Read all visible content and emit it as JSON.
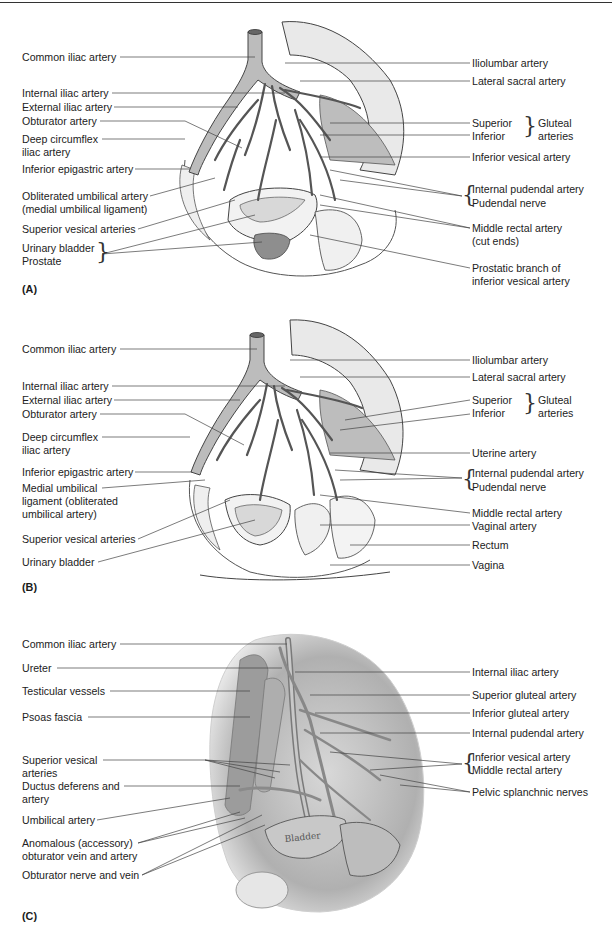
{
  "figure": {
    "panels": [
      {
        "id": "A",
        "panel_label": "(A)",
        "left_labels": [
          "Common iliac artery",
          "Internal iliac artery",
          "External iliac artery",
          "Obturator artery",
          "Deep circumflex",
          "iliac artery",
          "Inferior epigastric artery",
          "Obliterated umbilical artery",
          "(medial umbilical ligament)",
          "Superior vesical arteries",
          "Urinary bladder",
          "Prostate"
        ],
        "right_labels": [
          "Iliolumbar artery",
          "Lateral sacral artery",
          "Superior",
          "Inferior",
          "Gluteal",
          "arteries",
          "Inferior vesical artery",
          "Internal pudendal artery",
          "Pudendal nerve",
          "Middle rectal artery",
          "(cut ends)",
          "Prostatic branch of",
          "inferior vesical artery"
        ]
      },
      {
        "id": "B",
        "panel_label": "(B)",
        "left_labels": [
          "Common iliac artery",
          "Internal iliac artery",
          "External iliac artery",
          "Obturator artery",
          "Deep circumflex",
          "iliac artery",
          "Inferior epigastric artery",
          "Medial umbilical",
          "ligament (obliterated",
          "umbilical artery)",
          "Superior vesical arteries",
          "Urinary bladder"
        ],
        "right_labels": [
          "Iliolumbar artery",
          "Lateral sacral artery",
          "Superior",
          "Inferior",
          "Gluteal",
          "arteries",
          "Uterine artery",
          "Internal pudendal artery",
          "Pudendal nerve",
          "Middle rectal artery",
          "Vaginal artery",
          "Rectum",
          "Vagina"
        ]
      },
      {
        "id": "C",
        "panel_label": "(C)",
        "left_labels": [
          "Common iliac artery",
          "Ureter",
          "Testicular vessels",
          "Psoas fascia",
          "Superior vesical",
          "arteries",
          "Ductus deferens and",
          "artery",
          "Umbilical artery",
          "Anomalous (accessory)",
          "obturator vein and artery",
          "Obturator nerve and vein"
        ],
        "right_labels": [
          "Internal iliac artery",
          "Superior gluteal artery",
          "Inferior gluteal artery",
          "Internal pudendal artery",
          "Inferior vesical artery",
          "Middle rectal artery",
          "Pelvic splanchnic nerves"
        ],
        "inline_text": "Bladder"
      }
    ]
  }
}
